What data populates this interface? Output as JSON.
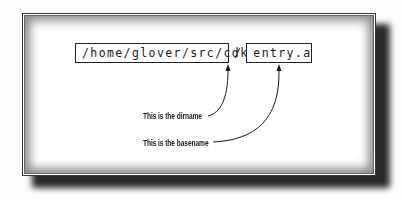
{
  "diagram": {
    "dirname_box": "/home/glover/src/cdk",
    "separator": "/",
    "basename_box": "entry.a",
    "annotations": {
      "dirname_label": "This is the dirname",
      "basename_label": "This is the basename"
    },
    "colors": {
      "ink": "#1a1a1a",
      "frame_border": "#3a3a3a",
      "shadow": "#2a2a2a",
      "background": "#ffffff"
    }
  }
}
